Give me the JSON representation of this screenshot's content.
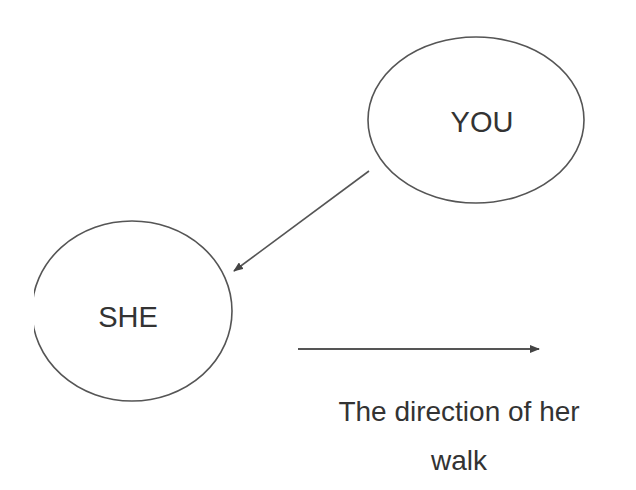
{
  "diagram": {
    "nodes": [
      {
        "id": "you",
        "label": "YOU"
      },
      {
        "id": "she",
        "label": "SHE"
      }
    ],
    "edges": [
      {
        "from": "you",
        "to": "she"
      }
    ],
    "direction_arrow": {
      "caption_line1": "The direction of her",
      "caption_line2": "walk"
    },
    "colors": {
      "stroke": "#555555",
      "text": "#333333",
      "background": "#ffffff"
    }
  }
}
